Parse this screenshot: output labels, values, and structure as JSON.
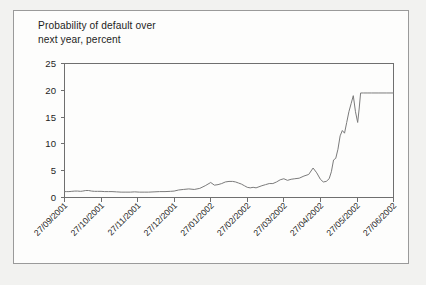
{
  "figure": {
    "title_line1": "Probability of default over",
    "title_line2": "next year, percent",
    "title": "Probability of default over\n  next year, percent",
    "border_color": "#9a9a9a",
    "background_color": "#fdfdfc",
    "page_background": "#f2f2f0"
  },
  "chart_data": {
    "type": "line",
    "title": "Probability of default over next year, percent",
    "xlabel": "",
    "ylabel": "Probability of default over next year, percent",
    "ylim": [
      0,
      25
    ],
    "yticks": [
      0,
      5,
      10,
      15,
      20,
      25
    ],
    "ytick_labels": [
      "0",
      "5",
      "10",
      "15",
      "20",
      "25"
    ],
    "grid": false,
    "legend": false,
    "line_color": "#7b7b7b",
    "axis_color": "#6f6f6f",
    "categories": [
      "27/09/2001",
      "27/10/2001",
      "27/11/2001",
      "27/12/2001",
      "27/01/2002",
      "27/02/2002",
      "27/03/2002",
      "27/04/2002",
      "27/05/2002",
      "27/06/2002"
    ],
    "xtick_labels": [
      "27/09/2001",
      "27/10/2001",
      "27/11/2001",
      "27/12/2001",
      "27/01/2002",
      "27/02/2002",
      "27/03/2002",
      "27/04/2002",
      "27/05/2002",
      "27/06/2002"
    ],
    "x_axis_start": "27/09/2001",
    "x_axis_end": "27/06/2002",
    "series": [
      {
        "name": "Probability of default over next year",
        "x": [
          0.0,
          0.06,
          0.12,
          0.2,
          0.28,
          0.36,
          0.44,
          0.5,
          0.58,
          0.66,
          0.74,
          0.82,
          0.9,
          1.0,
          1.1,
          1.2,
          1.3,
          1.42,
          1.55,
          1.68,
          1.8,
          1.92,
          2.05,
          2.18,
          2.3,
          2.45,
          2.6,
          2.75,
          2.9,
          3.0,
          3.12,
          3.25,
          3.4,
          3.55,
          3.7,
          3.85,
          4.0,
          4.1,
          4.2,
          4.3,
          4.4,
          4.5,
          4.6,
          4.68,
          4.76,
          4.84,
          4.92,
          5.0,
          5.08,
          5.16,
          5.24,
          5.32,
          5.4,
          5.5,
          5.6,
          5.7,
          5.8,
          5.9,
          6.0,
          6.1,
          6.2,
          6.3,
          6.42,
          6.55,
          6.68,
          6.8,
          6.9,
          7.0,
          7.08,
          7.16,
          7.24,
          7.3,
          7.36,
          7.42,
          7.48,
          7.54,
          7.6,
          7.66,
          7.72,
          7.78,
          7.84,
          7.9,
          7.96,
          8.02,
          8.06,
          8.1,
          8.14,
          8.18,
          8.22,
          8.3,
          8.4,
          8.6,
          8.8,
          9.0
        ],
        "values": [
          1.1,
          1.1,
          1.1,
          1.15,
          1.2,
          1.2,
          1.15,
          1.2,
          1.3,
          1.3,
          1.2,
          1.15,
          1.15,
          1.15,
          1.1,
          1.1,
          1.1,
          1.05,
          1.0,
          1.0,
          1.0,
          1.05,
          1.0,
          1.0,
          1.0,
          1.05,
          1.1,
          1.1,
          1.15,
          1.2,
          1.4,
          1.5,
          1.6,
          1.5,
          1.7,
          2.2,
          2.8,
          2.3,
          2.4,
          2.6,
          2.9,
          3.0,
          3.0,
          2.9,
          2.7,
          2.5,
          2.2,
          1.9,
          1.8,
          1.9,
          1.8,
          2.0,
          2.2,
          2.4,
          2.6,
          2.6,
          2.9,
          3.3,
          3.5,
          3.2,
          3.4,
          3.5,
          3.6,
          4.0,
          4.3,
          5.5,
          4.6,
          3.4,
          2.9,
          3.0,
          3.5,
          4.8,
          7.0,
          7.3,
          9.0,
          11.5,
          12.5,
          12.0,
          14.0,
          16.0,
          17.5,
          19.0,
          16.0,
          14.0,
          16.5,
          19.5,
          19.5,
          19.5,
          19.5,
          19.5,
          19.5,
          19.5,
          19.5,
          19.5
        ]
      }
    ],
    "annotations": [
      {
        "text": "flat baseline near 1 percent from 27/09/2001 to 27/01/2002"
      },
      {
        "text": "sharp rise to about 19 percent in late 04/2002"
      },
      {
        "text": "plateau at about 19.5 percent from 05/2002 onwards"
      }
    ]
  }
}
